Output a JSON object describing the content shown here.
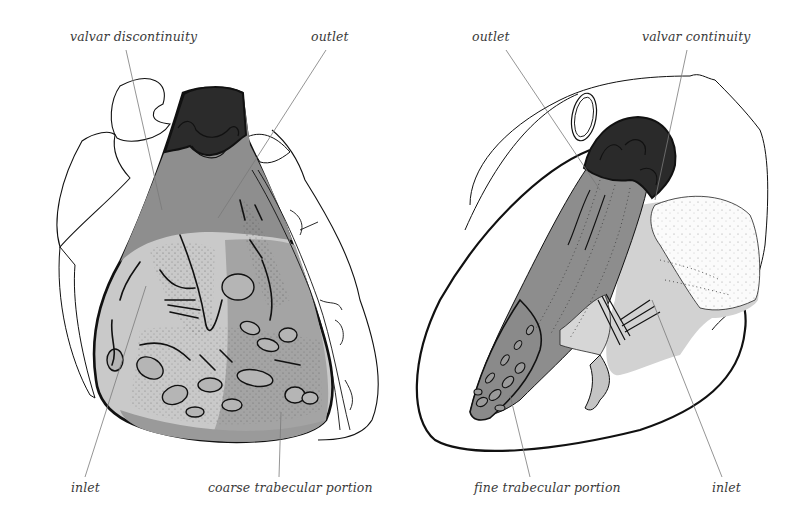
{
  "figure": {
    "left_panel": {
      "labels": {
        "valvar": "valvar discontinuity",
        "outlet": "outlet",
        "inlet": "inlet",
        "trabecular": "coarse trabecular portion"
      }
    },
    "right_panel": {
      "labels": {
        "outlet": "outlet",
        "valvar": "valvar continuity",
        "trabecular": "fine trabecular portion",
        "inlet": "inlet"
      }
    },
    "colors": {
      "outlet_dark": "#2a2a2a",
      "outlet_mid": "#8a8a8a",
      "trabecular_mid": "#9c9c9c",
      "inlet_light": "#c9c9c9",
      "line": "#111111",
      "leader": "#7a7a7a",
      "label_text": "#3a3a3a"
    }
  }
}
